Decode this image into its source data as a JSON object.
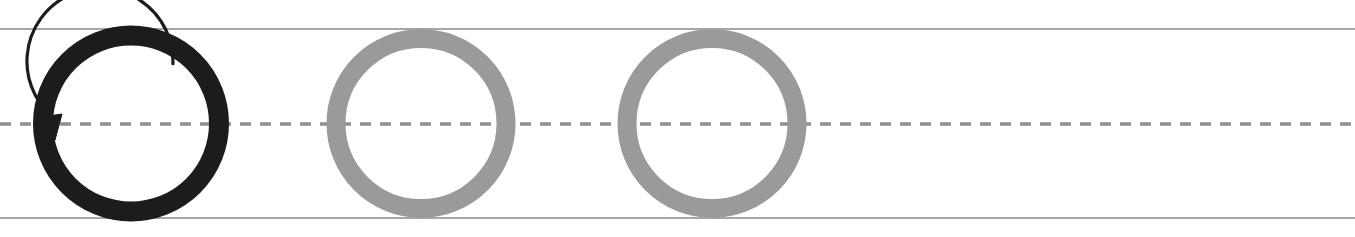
{
  "worksheet": {
    "type": "handwriting-tracing-row",
    "letter": "O",
    "letterform": "uppercase-O",
    "stroke_count": 1,
    "stroke_direction": "counterclockwise",
    "background_color": "#ffffff",
    "width": 1355,
    "height": 237
  },
  "ruling": {
    "top_line": {
      "label": "top line",
      "y": 29,
      "color": "#8a8a8a",
      "thickness": 1.6,
      "style": "solid"
    },
    "mid_line": {
      "label": "dashed midline",
      "y": 124,
      "color": "#8f8f8f",
      "thickness": 3.4,
      "style": "dashed",
      "dash_length": 11,
      "dash_gap": 9
    },
    "bottom_line": {
      "label": "baseline",
      "y": 218,
      "color": "#8a8a8a",
      "thickness": 1.6,
      "style": "solid"
    },
    "left_x": 0,
    "right_x": 1355
  },
  "glyphs": [
    {
      "index": 1,
      "name": "model-letter-o",
      "role": "model",
      "character": "O",
      "color": "#1c1c1c",
      "center_x": 131,
      "center_y": 123.5,
      "radius": 88,
      "stroke_width": 20,
      "has_direction_arrow": true
    },
    {
      "index": 2,
      "name": "trace-letter-o-1",
      "role": "trace",
      "character": "O",
      "color": "#9a9a9a",
      "center_x": 421,
      "center_y": 123.5,
      "radius": 85,
      "stroke_width": 19,
      "has_direction_arrow": false
    },
    {
      "index": 3,
      "name": "trace-letter-o-2",
      "role": "trace",
      "character": "O",
      "color": "#9a9a9a",
      "center_x": 712,
      "center_y": 123.5,
      "radius": 85,
      "stroke_width": 19,
      "has_direction_arrow": false
    }
  ],
  "direction_arrow": {
    "name": "stroke-direction-arrow",
    "color": "#1c1c1c",
    "stroke_width": 3.2,
    "start_angle_deg": -55,
    "end_angle_deg": 182,
    "radius": 73,
    "arrowhead_x": 55,
    "arrowhead_y": 132,
    "description": "counterclockwise arc from upper right over the top, arrowhead pointing down at the left midline"
  },
  "practice_area": {
    "name": "blank-practice-area",
    "start_x": 830,
    "end_x": 1355,
    "label": "",
    "empty": true
  }
}
